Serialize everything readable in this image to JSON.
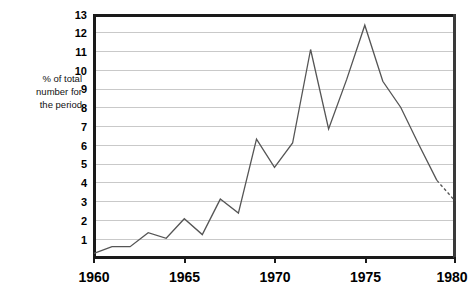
{
  "chart_data": {
    "type": "line",
    "title": "",
    "xlabel": "",
    "ylabel": "% of total number for the period",
    "ylabel_lines": [
      "% of total",
      "number for",
      "the period"
    ],
    "x": [
      1960,
      1961,
      1962,
      1963,
      1964,
      1965,
      1966,
      1967,
      1968,
      1969,
      1970,
      1971,
      1972,
      1973,
      1974,
      1975,
      1976,
      1977,
      1978,
      1979,
      1980
    ],
    "values": [
      0.2,
      0.55,
      0.55,
      1.3,
      1.0,
      2.05,
      1.2,
      3.1,
      2.35,
      6.3,
      4.8,
      6.1,
      11.1,
      6.85,
      9.5,
      12.4,
      9.4,
      8.0,
      6.0,
      4.1,
      3.0
    ],
    "series": [
      {
        "name": "% of total number for the period",
        "values": [
          0.2,
          0.55,
          0.55,
          1.3,
          1.0,
          2.05,
          1.2,
          3.1,
          2.35,
          6.3,
          4.8,
          6.1,
          11.1,
          6.85,
          9.5,
          12.4,
          9.4,
          8.0,
          6.0,
          4.1,
          3.0
        ]
      }
    ],
    "dashed_segment": {
      "from_x": 1979,
      "from_y": 4.1,
      "to_x": 1980,
      "to_y": 3.0,
      "style": "dashed"
    },
    "xlim": [
      1960,
      1980
    ],
    "ylim": [
      0,
      13
    ],
    "ytick_labels": [
      "1",
      "2",
      "3",
      "4",
      "5",
      "6",
      "7",
      "8",
      "9",
      "10",
      "11",
      "12",
      "13"
    ],
    "ytick_values": [
      1,
      2,
      3,
      4,
      5,
      6,
      7,
      8,
      9,
      10,
      11,
      12,
      13
    ],
    "xtick_labels": [
      "1960",
      "1965",
      "1970",
      "1975",
      "1980"
    ],
    "xtick_values": [
      1960,
      1965,
      1970,
      1975,
      1980
    ],
    "grid": "horizontal",
    "grid_color": "#c9c9c9",
    "line_color": "#555555",
    "axis_color": "#1a1a1a",
    "background": "#ffffff",
    "legend": "none"
  }
}
